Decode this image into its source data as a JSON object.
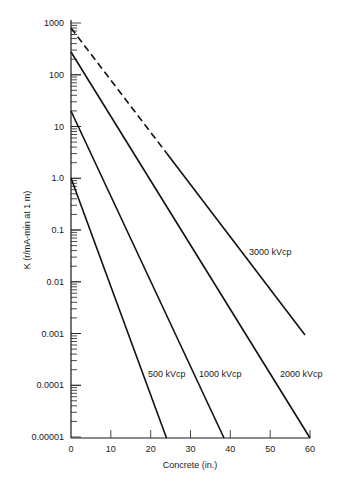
{
  "chart_data": {
    "type": "line",
    "title": "",
    "xlabel": "Concrete (in.)",
    "ylabel": "K (r/mA-min at 1 m)",
    "x_scale": "linear",
    "y_scale": "log",
    "xlim": [
      0,
      60
    ],
    "ylim": [
      1e-05,
      1000
    ],
    "x_ticks": [
      0,
      10,
      20,
      30,
      40,
      50,
      60
    ],
    "x_tick_labels": [
      "0",
      "10",
      "20",
      "30",
      "40",
      "50",
      "60"
    ],
    "y_ticks": [
      1000,
      100,
      10,
      1.0,
      0.1,
      0.01,
      0.001,
      0.0001,
      1e-05
    ],
    "y_tick_labels": [
      "1000",
      "100",
      "10",
      "1.0",
      "0.1",
      "0.01",
      "0.001",
      "0.0001",
      "0.00001"
    ],
    "grid": false,
    "legend": "inline labels near lines",
    "series": [
      {
        "name": "500 kVcp",
        "label": "500 kVcp",
        "x": [
          0,
          24
        ],
        "y": [
          1.0,
          1e-05
        ],
        "style": "solid"
      },
      {
        "name": "1000 kVcp",
        "label": "1000 kVcp",
        "x": [
          0,
          38.5
        ],
        "y": [
          20,
          1e-05
        ],
        "style": "solid"
      },
      {
        "name": "2000 kVcp",
        "label": "2000 kVcp",
        "x": [
          0,
          60
        ],
        "y": [
          280,
          1e-05
        ],
        "style": "solid"
      },
      {
        "name": "3000 kVcp",
        "label": "3000 kVcp",
        "x": [
          0,
          24,
          59
        ],
        "y": [
          800,
          3,
          0.001
        ],
        "style": "dashed from 0 to ~24 in, then solid"
      }
    ]
  },
  "labels": {
    "ylabel": "K (r/mA-min at 1 m)",
    "xlabel": "Concrete (in.)",
    "s500": "500 kVcp",
    "s1000": "1000 kVcp",
    "s2000": "2000 kVcp",
    "s3000": "3000 kVcp",
    "x0": "0",
    "x10": "10",
    "x20": "20",
    "x30": "30",
    "x40": "40",
    "x50": "50",
    "x60": "60",
    "y1000": "1000",
    "y100": "100",
    "y10": "10",
    "y1": "1.0",
    "y01": "0.1",
    "y001": "0.01",
    "y0001": "0.001",
    "y00001": "0.0001",
    "y000001": "0.00001"
  }
}
